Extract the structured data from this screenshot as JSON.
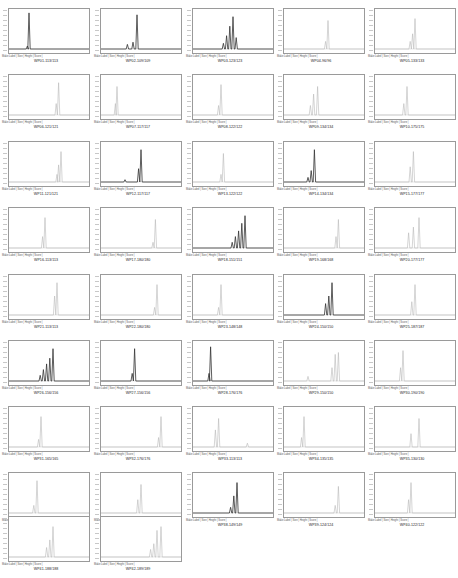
{
  "figure": {
    "title": "",
    "legend_text": "Make Label | Size | Height | Score |",
    "columns": 5
  },
  "chart_data": {
    "type": "line",
    "layout": {
      "rows": 9,
      "cols": 5,
      "panel_count": 42,
      "grid": false
    },
    "panels": [
      {
        "label": "WP01-113/113",
        "peaks": [
          [
            0.25,
            0.95,
            1
          ],
          [
            0.23,
            0.08,
            0
          ]
        ],
        "dark": true
      },
      {
        "label": "WP02-109/109",
        "peaks": [
          [
            0.45,
            0.9,
            1
          ],
          [
            0.4,
            0.18,
            0
          ],
          [
            0.33,
            0.12,
            0
          ]
        ],
        "dark": true
      },
      {
        "label": "WP03-123/123",
        "peaks": [
          [
            0.5,
            0.85,
            1
          ],
          [
            0.46,
            0.6,
            1
          ],
          [
            0.42,
            0.35,
            1
          ],
          [
            0.54,
            0.3,
            0
          ],
          [
            0.38,
            0.15,
            0
          ]
        ],
        "dark": true
      },
      {
        "label": "WP04-96/96",
        "peaks": [
          [
            0.55,
            0.75,
            0
          ],
          [
            0.52,
            0.2,
            0
          ]
        ],
        "dark": false
      },
      {
        "label": "WP05-133/133",
        "peaks": [
          [
            0.5,
            0.8,
            0
          ],
          [
            0.47,
            0.4,
            0
          ],
          [
            0.44,
            0.2,
            0
          ]
        ],
        "dark": false
      },
      {
        "label": "WP06-121/121",
        "peaks": [
          [
            0.62,
            0.85,
            0
          ],
          [
            0.59,
            0.3,
            0
          ]
        ],
        "dark": false
      },
      {
        "label": "WP07-117/117",
        "peaks": [
          [
            0.2,
            0.75,
            0
          ],
          [
            0.18,
            0.3,
            0
          ]
        ],
        "dark": false
      },
      {
        "label": "WP08-122/122",
        "peaks": [
          [
            0.35,
            0.8,
            0
          ],
          [
            0.32,
            0.25,
            0
          ]
        ],
        "dark": false
      },
      {
        "label": "WP09-134/134",
        "peaks": [
          [
            0.42,
            0.75,
            0
          ],
          [
            0.37,
            0.55,
            0
          ],
          [
            0.33,
            0.25,
            0
          ]
        ],
        "dark": false
      },
      {
        "label": "WP10-175/175",
        "peaks": [
          [
            0.4,
            0.75,
            0
          ],
          [
            0.36,
            0.3,
            0
          ]
        ],
        "dark": false
      },
      {
        "label": "WP11-121/121",
        "peaks": [
          [
            0.65,
            0.8,
            0
          ],
          [
            0.62,
            0.45,
            0
          ],
          [
            0.6,
            0.2,
            0
          ]
        ],
        "dark": false
      },
      {
        "label": "WP12-117/117",
        "peaks": [
          [
            0.5,
            0.85,
            1
          ],
          [
            0.47,
            0.35,
            1
          ],
          [
            0.3,
            0.06,
            0
          ]
        ],
        "dark": true
      },
      {
        "label": "WP13-122/122",
        "peaks": [
          [
            0.38,
            0.75,
            0
          ],
          [
            0.35,
            0.2,
            0
          ]
        ],
        "dark": false
      },
      {
        "label": "WP14-134/134",
        "peaks": [
          [
            0.38,
            0.85,
            1
          ],
          [
            0.34,
            0.3,
            0
          ],
          [
            0.3,
            0.12,
            0
          ]
        ],
        "dark": true
      },
      {
        "label": "WP15-177/177",
        "peaks": [
          [
            0.48,
            0.8,
            0
          ],
          [
            0.44,
            0.4,
            0
          ]
        ],
        "dark": false
      },
      {
        "label": "WP16-113/113",
        "peaks": [
          [
            0.45,
            0.8,
            0
          ],
          [
            0.42,
            0.3,
            0
          ]
        ],
        "dark": false
      },
      {
        "label": "WP17-180/180",
        "peaks": [
          [
            0.68,
            0.75,
            0
          ],
          [
            0.65,
            0.15,
            0
          ]
        ],
        "dark": false
      },
      {
        "label": "WP18-151/151",
        "peaks": [
          [
            0.65,
            0.85,
            1
          ],
          [
            0.61,
            0.65,
            1
          ],
          [
            0.57,
            0.45,
            1
          ],
          [
            0.53,
            0.3,
            1
          ],
          [
            0.49,
            0.15,
            0
          ]
        ],
        "dark": true
      },
      {
        "label": "WP19-168/168",
        "peaks": [
          [
            0.68,
            0.75,
            0
          ],
          [
            0.65,
            0.3,
            0
          ]
        ],
        "dark": false
      },
      {
        "label": "WP20-177/177",
        "peaks": [
          [
            0.55,
            0.8,
            0
          ],
          [
            0.48,
            0.55,
            0
          ],
          [
            0.42,
            0.4,
            0
          ]
        ],
        "dark": false
      },
      {
        "label": "WP21-113/113",
        "peaks": [
          [
            0.6,
            0.85,
            0
          ],
          [
            0.57,
            0.5,
            0
          ]
        ],
        "dark": false
      },
      {
        "label": "WP22-180/180",
        "peaks": [
          [
            0.7,
            0.8,
            0
          ],
          [
            0.67,
            0.2,
            0
          ]
        ],
        "dark": false
      },
      {
        "label": "WP23-148/148",
        "peaks": [
          [
            0.35,
            0.8,
            0
          ],
          [
            0.32,
            0.2,
            0
          ]
        ],
        "dark": false
      },
      {
        "label": "WP24-150/150",
        "peaks": [
          [
            0.6,
            0.85,
            1
          ],
          [
            0.56,
            0.5,
            0
          ],
          [
            0.52,
            0.3,
            0
          ]
        ],
        "dark": true
      },
      {
        "label": "WP25-187/187",
        "peaks": [
          [
            0.5,
            0.8,
            0
          ],
          [
            0.46,
            0.35,
            0
          ]
        ],
        "dark": false
      },
      {
        "label": "WP26-156/156",
        "peaks": [
          [
            0.55,
            0.85,
            1
          ],
          [
            0.51,
            0.6,
            1
          ],
          [
            0.47,
            0.45,
            1
          ],
          [
            0.43,
            0.3,
            1
          ],
          [
            0.39,
            0.15,
            0
          ]
        ],
        "dark": true
      },
      {
        "label": "WP27-156/156",
        "peaks": [
          [
            0.42,
            0.85,
            1
          ],
          [
            0.39,
            0.2,
            0
          ]
        ],
        "dark": true
      },
      {
        "label": "WP28-176/176",
        "peaks": [
          [
            0.22,
            0.9,
            1
          ],
          [
            0.2,
            0.2,
            0
          ]
        ],
        "dark": true
      },
      {
        "label": "WP29-150/150",
        "peaks": [
          [
            0.68,
            0.75,
            0
          ],
          [
            0.64,
            0.7,
            0
          ],
          [
            0.6,
            0.35,
            0
          ],
          [
            0.3,
            0.12,
            0
          ]
        ],
        "dark": false
      },
      {
        "label": "WP30-190/190",
        "peaks": [
          [
            0.35,
            0.8,
            0
          ],
          [
            0.32,
            0.35,
            0
          ]
        ],
        "dark": false
      },
      {
        "label": "WP31-165/165",
        "peaks": [
          [
            0.4,
            0.8,
            0
          ],
          [
            0.37,
            0.2,
            0
          ]
        ],
        "dark": false
      },
      {
        "label": "WP32-176/176",
        "peaks": [
          [
            0.75,
            0.8,
            0
          ],
          [
            0.72,
            0.25,
            0
          ]
        ],
        "dark": false
      },
      {
        "label": "WP33-113/113",
        "peaks": [
          [
            0.32,
            0.75,
            0
          ],
          [
            0.28,
            0.45,
            0
          ],
          [
            0.68,
            0.1,
            0
          ]
        ],
        "dark": false
      },
      {
        "label": "WP34-135/135",
        "peaks": [
          [
            0.25,
            0.8,
            0
          ],
          [
            0.22,
            0.25,
            0
          ]
        ],
        "dark": false
      },
      {
        "label": "WP35-130/130",
        "peaks": [
          [
            0.55,
            0.75,
            0
          ],
          [
            0.45,
            0.35,
            0
          ]
        ],
        "dark": false
      },
      {
        "label": "WP36-154/154",
        "peaks": [
          [
            0.35,
            0.85,
            0
          ],
          [
            0.31,
            0.2,
            0
          ]
        ],
        "dark": false
      },
      {
        "label": "WP37-176/176",
        "peaks": [
          [
            0.5,
            0.75,
            0
          ],
          [
            0.46,
            0.35,
            0
          ]
        ],
        "dark": false
      },
      {
        "label": "WP38-149/149",
        "peaks": [
          [
            0.55,
            0.8,
            1
          ],
          [
            0.51,
            0.45,
            1
          ],
          [
            0.47,
            0.15,
            0
          ]
        ],
        "dark": true
      },
      {
        "label": "WP39-124/124",
        "peaks": [
          [
            0.68,
            0.7,
            0
          ],
          [
            0.64,
            0.2,
            0
          ]
        ],
        "dark": false
      },
      {
        "label": "WP40-122/122",
        "peaks": [
          [
            0.45,
            0.8,
            0
          ],
          [
            0.42,
            0.35,
            0
          ]
        ],
        "dark": false
      },
      {
        "label": "WP41-188/188",
        "peaks": [
          [
            0.55,
            0.8,
            0
          ],
          [
            0.51,
            0.45,
            0
          ],
          [
            0.47,
            0.25,
            0
          ]
        ],
        "dark": false
      },
      {
        "label": "WP42-189/189",
        "peaks": [
          [
            0.75,
            0.8,
            0
          ],
          [
            0.7,
            0.7,
            0
          ],
          [
            0.66,
            0.35,
            0
          ],
          [
            0.62,
            0.2,
            0
          ]
        ],
        "dark": false
      }
    ]
  }
}
